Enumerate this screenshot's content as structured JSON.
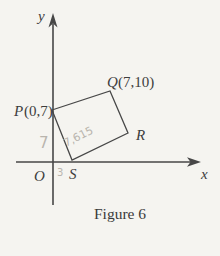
{
  "figure": {
    "caption": "Figure 6",
    "axes": {
      "x_label": "x",
      "y_label": "y",
      "origin_label": "O"
    },
    "vertices": {
      "P": {
        "name": "P",
        "coords": "(0,7)"
      },
      "Q": {
        "name": "Q",
        "coords": "(7,10)"
      },
      "R": {
        "name": "R"
      },
      "S": {
        "name": "S"
      }
    },
    "pencil_marks": {
      "side_length_note": "7,615",
      "y_axis_note": "7",
      "x_axis_note": "3"
    },
    "colors": {
      "ink": "#474747",
      "pencil": "#b9b5ae",
      "paper": "#f5f4f0"
    }
  }
}
